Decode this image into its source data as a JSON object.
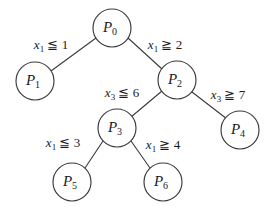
{
  "figure": {
    "background_color": "#ffffff",
    "stroke_color": "#3a3a3c",
    "text_color": "#1a1a1c",
    "width": 276,
    "height": 214
  },
  "nodes": [
    {
      "id": "P0",
      "symbol": "P",
      "subscript": "0",
      "cx": 112,
      "cy": 28,
      "r": 19
    },
    {
      "id": "P1",
      "symbol": "P",
      "subscript": "1",
      "cx": 35,
      "cy": 81,
      "r": 19
    },
    {
      "id": "P2",
      "symbol": "P",
      "subscript": "2",
      "cx": 177,
      "cy": 80,
      "r": 19
    },
    {
      "id": "P3",
      "symbol": "P",
      "subscript": "3",
      "cx": 117,
      "cy": 128,
      "r": 19
    },
    {
      "id": "P4",
      "symbol": "P",
      "subscript": "4",
      "cx": 240,
      "cy": 130,
      "r": 19
    },
    {
      "id": "P5",
      "symbol": "P",
      "subscript": "5",
      "cx": 72,
      "cy": 182,
      "r": 19
    },
    {
      "id": "P6",
      "symbol": "P",
      "subscript": "6",
      "cx": 163,
      "cy": 182,
      "r": 19
    }
  ],
  "edges": [
    {
      "id": "P0-P1",
      "from": "P0",
      "to": "P1",
      "x1": 96,
      "y1": 38,
      "x2": 51,
      "y2": 71,
      "label": {
        "var": "x",
        "sub": "1",
        "rel": "≦",
        "num": "1",
        "x": 51,
        "y": 46
      }
    },
    {
      "id": "P0-P2",
      "from": "P0",
      "to": "P2",
      "x1": 128,
      "y1": 38,
      "x2": 162,
      "y2": 69,
      "label": {
        "var": "x",
        "sub": "1",
        "rel": "≧",
        "num": "2",
        "x": 165,
        "y": 46
      }
    },
    {
      "id": "P2-P3",
      "from": "P2",
      "to": "P3",
      "x1": 162,
      "y1": 91,
      "x2": 131,
      "y2": 117,
      "label": {
        "var": "x",
        "sub": "3",
        "rel": "≦",
        "num": "6",
        "x": 122,
        "y": 94
      }
    },
    {
      "id": "P2-P4",
      "from": "P2",
      "to": "P4",
      "x1": 192,
      "y1": 92,
      "x2": 227,
      "y2": 119,
      "label": {
        "var": "x",
        "sub": "3",
        "rel": "≧",
        "num": "7",
        "x": 228,
        "y": 96
      }
    },
    {
      "id": "P3-P5",
      "from": "P3",
      "to": "P5",
      "x1": 103,
      "y1": 141,
      "x2": 85,
      "y2": 168,
      "label": {
        "var": "x",
        "sub": "1",
        "rel": "≦",
        "num": "3",
        "x": 63,
        "y": 144
      }
    },
    {
      "id": "P3-P6",
      "from": "P3",
      "to": "P6",
      "x1": 131,
      "y1": 141,
      "x2": 150,
      "y2": 168,
      "label": {
        "var": "x",
        "sub": "1",
        "rel": "≧",
        "num": "4",
        "x": 163,
        "y": 146
      }
    }
  ],
  "chart_data": {
    "type": "diagram",
    "diagram_kind": "binary-branching-tree",
    "node_labels": [
      "P0",
      "P1",
      "P2",
      "P3",
      "P4",
      "P5",
      "P6"
    ],
    "edge_labels": [
      "x1 ≦ 1",
      "x1 ≧ 2",
      "x3 ≦ 6",
      "x3 ≧ 7",
      "x1 ≦ 3",
      "x1 ≧ 4"
    ],
    "edges": [
      [
        "P0",
        "P1",
        "x1 ≦ 1"
      ],
      [
        "P0",
        "P2",
        "x1 ≧ 2"
      ],
      [
        "P2",
        "P3",
        "x3 ≦ 6"
      ],
      [
        "P2",
        "P4",
        "x3 ≧ 7"
      ],
      [
        "P3",
        "P5",
        "x1 ≦ 3"
      ],
      [
        "P3",
        "P6",
        "x1 ≧ 4"
      ]
    ],
    "leaves": [
      "P1",
      "P4",
      "P5",
      "P6"
    ],
    "root": "P0",
    "depth": 4
  }
}
